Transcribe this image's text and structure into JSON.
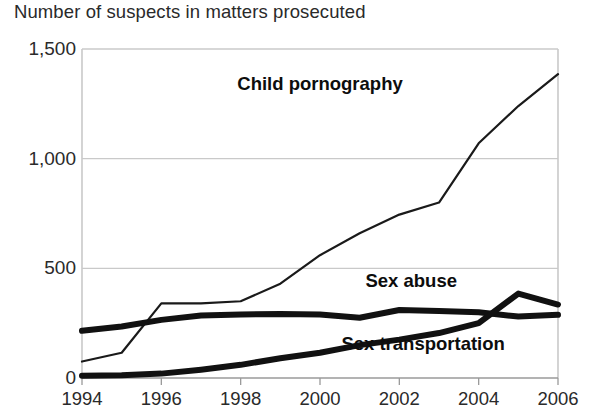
{
  "chart_data": {
    "type": "line",
    "title": "Number of suspects in matters prosecuted",
    "xlabel": "",
    "ylabel": "",
    "grid": true,
    "legend_position": "inline-annotations",
    "xlim": [
      1994,
      2006
    ],
    "ylim": [
      0,
      1500
    ],
    "x": [
      1994,
      1995,
      1996,
      1997,
      1998,
      1999,
      2000,
      2001,
      2002,
      2003,
      2004,
      2005,
      2006
    ],
    "xticks": [
      "1994",
      "1996",
      "1998",
      "2000",
      "2002",
      "2004",
      "2006"
    ],
    "yticks": [
      "0",
      "500",
      "1,000",
      "1,500"
    ],
    "series": [
      {
        "name": "Child pornography",
        "values": [
          75,
          115,
          340,
          340,
          350,
          430,
          560,
          660,
          745,
          800,
          1070,
          1240,
          1385
        ],
        "style": "thin",
        "color": "#1a1a1a",
        "label_x": 2000.0,
        "label_y": 1340
      },
      {
        "name": "Sex abuse",
        "values": [
          215,
          235,
          265,
          285,
          290,
          292,
          290,
          275,
          310,
          305,
          300,
          280,
          288
        ],
        "style": "thick",
        "color": "#111111",
        "label_x": 2002.3,
        "label_y": 440
      },
      {
        "name": "Sex transportation",
        "values": [
          10,
          12,
          20,
          38,
          60,
          90,
          115,
          150,
          175,
          205,
          250,
          385,
          335
        ],
        "style": "thick",
        "color": "#111111",
        "label_x": 2002.6,
        "label_y": 155
      }
    ]
  },
  "axes": {
    "grid_color": "#c9c9c9",
    "axis_color": "#8a8a8a",
    "background": "#ffffff"
  }
}
